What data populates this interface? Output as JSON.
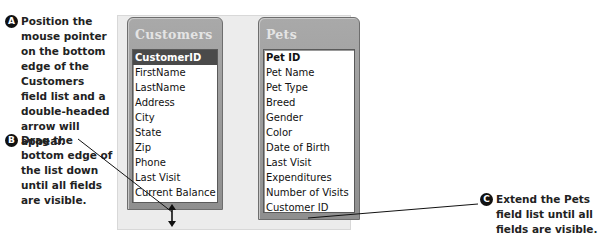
{
  "callouts": [
    {
      "badge": "A",
      "text": "Position the mouse pointer on the bottom edge of the Customers field list and a double-headed arrow will appear."
    },
    {
      "badge": "B",
      "text": "Drag the bottom edge of the list down until all fields are visible."
    },
    {
      "badge": "C",
      "text": "Extend the Pets field list until all fields are visible."
    }
  ],
  "field_lists": {
    "customers": {
      "title": "Customers",
      "fields": [
        "CustomerID",
        "FirstName",
        "LastName",
        "Address",
        "City",
        "State",
        "Zip",
        "Phone",
        "Last Visit",
        "Current Balance"
      ],
      "selected": "CustomerID"
    },
    "pets": {
      "title": "Pets",
      "fields": [
        "Pet ID",
        "Pet Name",
        "Pet Type",
        "Breed",
        "Gender",
        "Color",
        "Date of Birth",
        "Last Visit",
        "Expenditures",
        "Number of Visits",
        "Customer ID"
      ],
      "primary_key": "Pet ID"
    }
  },
  "cursor": {
    "icon": "double-headed-vertical-resize-arrow"
  }
}
